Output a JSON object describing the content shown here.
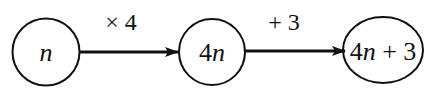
{
  "diagram": {
    "type": "flow",
    "nodes": [
      {
        "id": "n1",
        "label_parts": [
          {
            "text": "n",
            "italic": true
          }
        ]
      },
      {
        "id": "n2",
        "label_parts": [
          {
            "text": "4",
            "italic": false
          },
          {
            "text": "n",
            "italic": true
          }
        ]
      },
      {
        "id": "n3",
        "label_parts": [
          {
            "text": "4",
            "italic": false
          },
          {
            "text": "n",
            "italic": true
          },
          {
            "text": " + 3",
            "italic": false
          }
        ]
      }
    ],
    "edges": [
      {
        "from": "n1",
        "to": "n2",
        "label": "× 4"
      },
      {
        "from": "n2",
        "to": "n3",
        "label": "+ 3"
      }
    ]
  },
  "colors": {
    "stroke": "#111111",
    "background": "#ffffff"
  }
}
